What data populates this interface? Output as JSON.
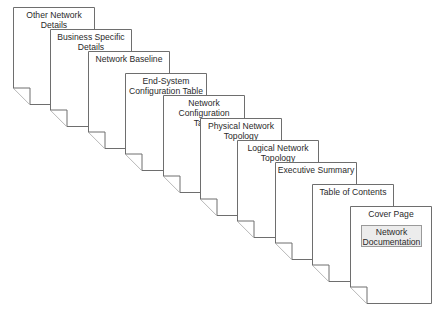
{
  "diagram": {
    "type": "stacked-document-pages",
    "pages": [
      {
        "title": "Other Network Details",
        "lines": [
          "Other Network",
          "Details"
        ]
      },
      {
        "title": "Business Specific Details",
        "lines": [
          "Business Specific",
          "Details"
        ]
      },
      {
        "title": "Network Baseline",
        "lines": [
          "Network Baseline"
        ]
      },
      {
        "title": "End-System Configuration Table",
        "lines": [
          "End-System",
          "Configuration Table"
        ]
      },
      {
        "title": "Network Configuration Table",
        "lines": [
          "Network Configuration",
          "Table"
        ]
      },
      {
        "title": "Physical Network Topology",
        "lines": [
          "Physical Network",
          "Topology"
        ]
      },
      {
        "title": "Logical Network Topology",
        "lines": [
          "Logical Network",
          "Topology"
        ]
      },
      {
        "title": "Executive Summary",
        "lines": [
          "Executive Summary"
        ]
      },
      {
        "title": "Table of Contents",
        "lines": [
          "Table of Contents"
        ]
      },
      {
        "title": "Cover Page",
        "lines": [
          "Cover Page"
        ],
        "box": [
          "Network",
          "Documentation"
        ]
      }
    ],
    "colors": {
      "stroke": "#6e6e6e",
      "page_fill": "#ffffff",
      "box_fill": "#ececec",
      "text": "#2a2a2a"
    }
  }
}
